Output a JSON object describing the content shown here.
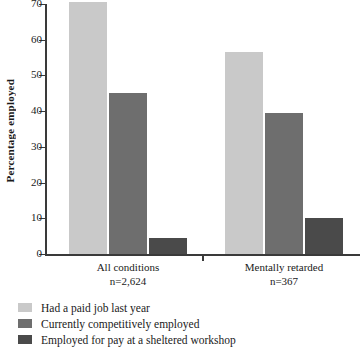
{
  "chart_data": {
    "type": "bar",
    "title": "",
    "xlabel": "",
    "ylabel": "Percentage employed",
    "ylim": [
      0,
      70
    ],
    "yticks": [
      0,
      10,
      20,
      30,
      40,
      50,
      60,
      70
    ],
    "grid": false,
    "legend_position": "bottom-left",
    "categories": [
      "All conditions",
      "Mentally retarded"
    ],
    "category_sublabels": [
      "n=2,624",
      "n=367"
    ],
    "series": [
      {
        "name": "Had a paid job last year",
        "color": "#c9c9c9",
        "values": [
          70.5,
          56.5
        ]
      },
      {
        "name": "Currently competitively employed",
        "color": "#6e6e6e",
        "values": [
          45,
          39.5
        ]
      },
      {
        "name": "Employed for pay at a sheltered workshop",
        "color": "#4a4a4a",
        "values": [
          4.5,
          10
        ]
      }
    ]
  },
  "axis": {
    "y_title": "Percentage employed",
    "y_tick_labels": [
      "70",
      "60",
      "50",
      "40",
      "30",
      "20",
      "10",
      "0"
    ]
  },
  "categories": [
    {
      "name": "All conditions",
      "n": "n=2,624"
    },
    {
      "name": "Mentally retarded",
      "n": "n=367"
    }
  ],
  "legend": [
    {
      "label": "Had a paid job last year",
      "color": "#c9c9c9"
    },
    {
      "label": "Currently competitively employed",
      "color": "#6e6e6e"
    },
    {
      "label": "Employed for pay at a sheltered workshop",
      "color": "#4a4a4a"
    }
  ],
  "colors": {
    "axis": "#3a3a3a",
    "background": "#ffffff",
    "text": "#1a1a1a",
    "series_light": "#c9c9c9",
    "series_medium": "#6e6e6e",
    "series_dark": "#4a4a4a"
  }
}
